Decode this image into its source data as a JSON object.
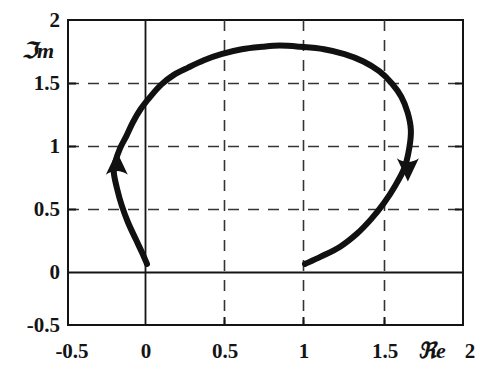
{
  "figure": {
    "kind": "complex-plane-contour-plot",
    "background_color": "#ffffff",
    "ink_color": "#141414",
    "grid_color": "#3a3a3a",
    "curve_color": "#111111"
  },
  "axes": {
    "x_label": "ℜe",
    "y_label": "ℑm",
    "x_ticks": [
      "-0.5",
      "0",
      "0.5",
      "1",
      "1.5",
      "2"
    ],
    "y_ticks": [
      "2",
      "1.5",
      "1",
      "0.5",
      "0",
      "-0.5"
    ]
  },
  "chart_data": {
    "type": "line",
    "title": "",
    "xlabel": "ℜe",
    "ylabel": "ℑm",
    "xlim": [
      -0.5,
      2
    ],
    "ylim": [
      -0.5,
      2
    ],
    "xticks": [
      -0.5,
      0,
      0.5,
      1,
      1.5,
      2
    ],
    "yticks": [
      -0.5,
      0,
      0.5,
      1,
      1.5,
      2
    ],
    "xticklabels": [
      "-0.5",
      "0",
      "0.5",
      "1",
      "1.5",
      "2"
    ],
    "yticklabels": [
      "-0.5",
      "0",
      "0.5",
      "1",
      "1.5",
      "2"
    ],
    "grid": true,
    "grid_style": "dashed",
    "grid_lines_x": [
      0.5,
      1.0,
      1.5
    ],
    "grid_lines_y": [
      0.5,
      1.0,
      1.5
    ],
    "axis_lines": {
      "x_axis_at_y": 0,
      "y_axis_at_x": 0
    },
    "legend": null,
    "series": [
      {
        "name": "contour",
        "style": "thick-solid",
        "linewidth": 6,
        "closed": false,
        "direction": "counter-clockwise-open-arc",
        "start_point": [
          1.0,
          0.0
        ],
        "end_point": [
          0.0,
          0.0
        ],
        "points": [
          [
            1.0,
            0.0
          ],
          [
            1.1,
            0.06
          ],
          [
            1.22,
            0.14
          ],
          [
            1.33,
            0.25
          ],
          [
            1.42,
            0.37
          ],
          [
            1.5,
            0.5
          ],
          [
            1.57,
            0.64
          ],
          [
            1.63,
            0.79
          ],
          [
            1.66,
            0.95
          ],
          [
            1.67,
            1.1
          ],
          [
            1.65,
            1.24
          ],
          [
            1.61,
            1.37
          ],
          [
            1.55,
            1.48
          ],
          [
            1.47,
            1.58
          ],
          [
            1.37,
            1.66
          ],
          [
            1.25,
            1.72
          ],
          [
            1.12,
            1.76
          ],
          [
            0.97,
            1.78
          ],
          [
            0.84,
            1.79
          ],
          [
            0.73,
            1.78
          ],
          [
            0.6,
            1.76
          ],
          [
            0.47,
            1.72
          ],
          [
            0.36,
            1.67
          ],
          [
            0.26,
            1.61
          ],
          [
            0.17,
            1.55
          ],
          [
            0.09,
            1.47
          ],
          [
            0.02,
            1.37
          ],
          [
            -0.04,
            1.27
          ],
          [
            -0.09,
            1.16
          ],
          [
            -0.13,
            1.05
          ],
          [
            -0.17,
            0.95
          ],
          [
            -0.2,
            0.84
          ],
          [
            -0.21,
            0.75
          ],
          [
            -0.19,
            0.62
          ],
          [
            -0.16,
            0.48
          ],
          [
            -0.12,
            0.34
          ],
          [
            -0.07,
            0.2
          ],
          [
            -0.03,
            0.09
          ],
          [
            0.0,
            0.0
          ]
        ]
      }
    ],
    "annotations": [
      {
        "kind": "arrowhead",
        "name": "left-direction-arrow",
        "at": [
          -0.21,
          0.8
        ],
        "points_toward": "up",
        "meaning": "travel direction on left branch"
      },
      {
        "kind": "arrowhead",
        "name": "right-direction-arrow",
        "at": [
          1.67,
          0.8
        ],
        "points_toward": "down",
        "meaning": "travel direction on right branch"
      }
    ],
    "notable_points": [
      {
        "label": "start on real axis",
        "value": [
          1.0,
          0.0
        ]
      },
      {
        "label": "end at origin",
        "value": [
          0.0,
          0.0
        ]
      },
      {
        "label": "apex (max imaginary part)",
        "value": [
          0.78,
          1.79
        ]
      },
      {
        "label": "rightmost point",
        "value": [
          1.67,
          1.05
        ]
      },
      {
        "label": "leftmost point",
        "value": [
          -0.21,
          0.78
        ]
      }
    ]
  }
}
